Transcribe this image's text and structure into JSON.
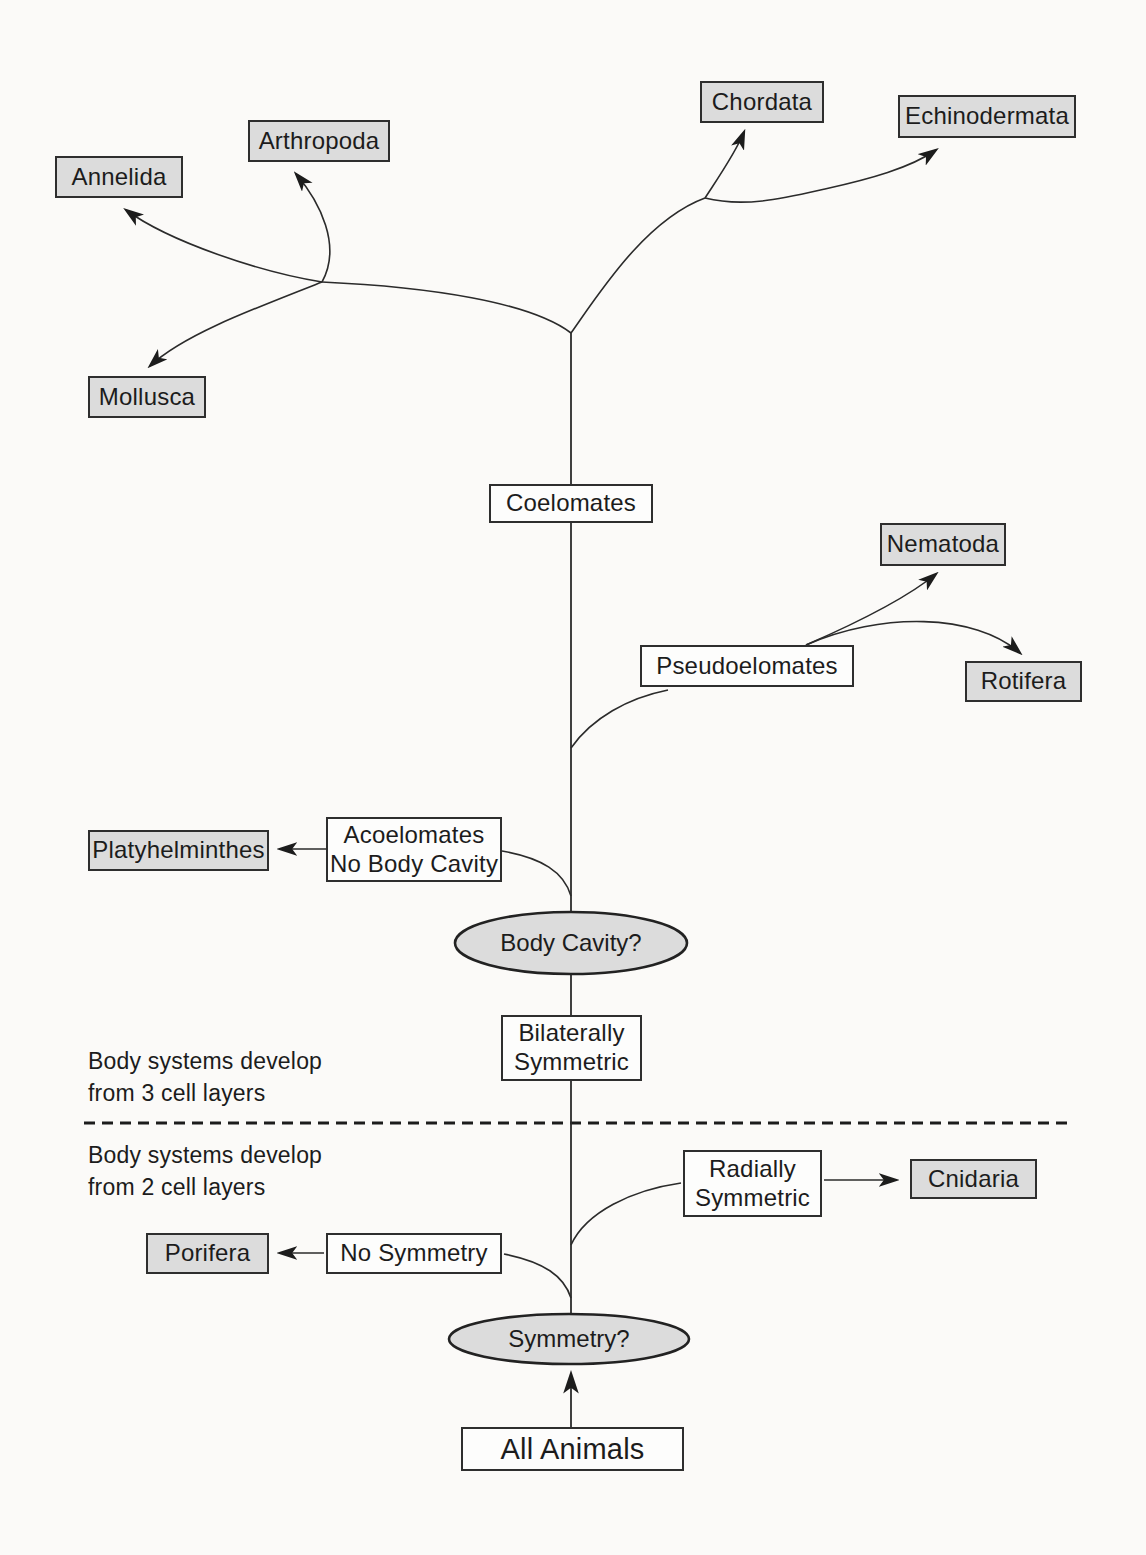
{
  "diagram": {
    "phyla": {
      "annelida": "Annelida",
      "arthropoda": "Arthropoda",
      "chordata": "Chordata",
      "echinodermata": "Echinodermata",
      "mollusca": "Mollusca",
      "nematoda": "Nematoda",
      "rotifera": "Rotifera",
      "platyhelminthes": "Platyhelminthes",
      "cnidaria": "Cnidaria",
      "porifera": "Porifera"
    },
    "groups": {
      "coelomates": "Coelomates",
      "pseudoelomates": "Pseudoelomates",
      "acoelomates_line1": "Acoelomates",
      "acoelomates_line2": "No Body Cavity",
      "bilateral_line1": "Bilaterally",
      "bilateral_line2": "Symmetric",
      "radial_line1": "Radially",
      "radial_line2": "Symmetric",
      "no_symmetry": "No Symmetry",
      "all_animals": "All Animals"
    },
    "decisions": {
      "body_cavity": "Body Cavity?",
      "symmetry": "Symmetry?"
    },
    "annotations": {
      "three_layers_line1": "Body systems develop",
      "three_layers_line2": "from 3 cell layers",
      "two_layers_line1": "Body systems develop",
      "two_layers_line2": "from 2 cell layers"
    },
    "colors": {
      "background": "#fbfaf8",
      "phylum_box_fill": "#dcdcdc",
      "group_box_fill": "#fdfdfc",
      "ellipse_fill": "#dcdcdc",
      "line": "#2b2b2b",
      "text": "#1c1c1c"
    }
  }
}
